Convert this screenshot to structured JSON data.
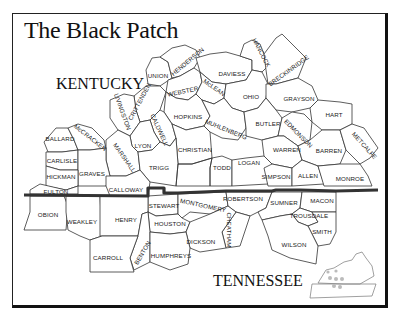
{
  "title": "The Black Patch",
  "states": {
    "kentucky": "KENTUCKY",
    "tennessee": "TENNESSEE"
  },
  "colors": {
    "ink": "#222222",
    "border_line": "#333333",
    "background": "#ffffff"
  },
  "counties": {
    "kentucky": [
      {
        "name": "UNION",
        "x": 158,
        "y": 76,
        "rot": 0
      },
      {
        "name": "HENDERSON",
        "x": 188,
        "y": 62,
        "rot": -40
      },
      {
        "name": "DAVIESS",
        "x": 232,
        "y": 74,
        "rot": 0
      },
      {
        "name": "HANCOCK",
        "x": 261,
        "y": 53,
        "rot": 62
      },
      {
        "name": "BRECKINRIDGE",
        "x": 289,
        "y": 71,
        "rot": -36
      },
      {
        "name": "WEBSTER",
        "x": 183,
        "y": 92,
        "rot": -12
      },
      {
        "name": "McLEAN",
        "x": 214,
        "y": 88,
        "rot": 35
      },
      {
        "name": "OHIO",
        "x": 251,
        "y": 97,
        "rot": 0
      },
      {
        "name": "GRAYSON",
        "x": 299,
        "y": 99,
        "rot": 0
      },
      {
        "name": "CRITTENDEN",
        "x": 140,
        "y": 102,
        "rot": -62
      },
      {
        "name": "LIVINGSTON",
        "x": 122,
        "y": 112,
        "rot": 70
      },
      {
        "name": "HOPKINS",
        "x": 188,
        "y": 117,
        "rot": 0
      },
      {
        "name": "MUHLENBERG",
        "x": 226,
        "y": 130,
        "rot": 22
      },
      {
        "name": "BUTLER",
        "x": 268,
        "y": 124,
        "rot": 0
      },
      {
        "name": "EDMONSON",
        "x": 298,
        "y": 134,
        "rot": 45
      },
      {
        "name": "HART",
        "x": 334,
        "y": 115,
        "rot": 0
      },
      {
        "name": "BALLARD",
        "x": 60,
        "y": 139,
        "rot": 0
      },
      {
        "name": "McCRACKEN",
        "x": 90,
        "y": 138,
        "rot": 38
      },
      {
        "name": "CALDWELL",
        "x": 159,
        "y": 130,
        "rot": 65
      },
      {
        "name": "LYON",
        "x": 143,
        "y": 146,
        "rot": 0
      },
      {
        "name": "MARSHALL",
        "x": 124,
        "y": 158,
        "rot": 55
      },
      {
        "name": "CHRISTIAN",
        "x": 195,
        "y": 150,
        "rot": 0
      },
      {
        "name": "WARREN",
        "x": 287,
        "y": 150,
        "rot": 0
      },
      {
        "name": "BARREN",
        "x": 329,
        "y": 151,
        "rot": 0
      },
      {
        "name": "METCALFE",
        "x": 364,
        "y": 146,
        "rot": 48
      },
      {
        "name": "CARLISLE",
        "x": 62,
        "y": 161,
        "rot": 0
      },
      {
        "name": "GRAVES",
        "x": 92,
        "y": 174,
        "rot": 0
      },
      {
        "name": "TRIGG",
        "x": 159,
        "y": 168,
        "rot": 0
      },
      {
        "name": "TODD",
        "x": 222,
        "y": 168,
        "rot": 0
      },
      {
        "name": "LOGAN",
        "x": 249,
        "y": 163,
        "rot": 0
      },
      {
        "name": "HICKMAN",
        "x": 61,
        "y": 177,
        "rot": 0
      },
      {
        "name": "SIMPSON",
        "x": 276,
        "y": 177,
        "rot": 0
      },
      {
        "name": "ALLEN",
        "x": 308,
        "y": 176,
        "rot": 0
      },
      {
        "name": "MONROE",
        "x": 350,
        "y": 179,
        "rot": 0
      },
      {
        "name": "FULTON",
        "x": 56,
        "y": 192,
        "rot": 0
      },
      {
        "name": "CALLOWAY",
        "x": 126,
        "y": 190,
        "rot": 0
      }
    ],
    "tennessee": [
      {
        "name": "STEWART",
        "x": 164,
        "y": 206,
        "rot": 0
      },
      {
        "name": "MONTGOMERY",
        "x": 203,
        "y": 206,
        "rot": 12
      },
      {
        "name": "ROBERTSON",
        "x": 243,
        "y": 199,
        "rot": 0
      },
      {
        "name": "SUMNER",
        "x": 284,
        "y": 203,
        "rot": 0
      },
      {
        "name": "MACON",
        "x": 322,
        "y": 201,
        "rot": 0
      },
      {
        "name": "OBION",
        "x": 48,
        "y": 215,
        "rot": 0
      },
      {
        "name": "WEAKLEY",
        "x": 82,
        "y": 222,
        "rot": 0
      },
      {
        "name": "HENRY",
        "x": 126,
        "y": 220,
        "rot": 0
      },
      {
        "name": "HOUSTON",
        "x": 170,
        "y": 224,
        "rot": 0
      },
      {
        "name": "CHEATHAM",
        "x": 229,
        "y": 230,
        "rot": 90
      },
      {
        "name": "TROUSDALE",
        "x": 309,
        "y": 216,
        "rot": 0
      },
      {
        "name": "SMITH",
        "x": 322,
        "y": 232,
        "rot": 0
      },
      {
        "name": "DICKSON",
        "x": 201,
        "y": 242,
        "rot": 0
      },
      {
        "name": "BENTON",
        "x": 143,
        "y": 253,
        "rot": -60
      },
      {
        "name": "CARROLL",
        "x": 108,
        "y": 258,
        "rot": 0
      },
      {
        "name": "HUMPHREYS",
        "x": 171,
        "y": 256,
        "rot": 0
      },
      {
        "name": "WILSON",
        "x": 294,
        "y": 245,
        "rot": 0
      }
    ]
  },
  "inset": {
    "label": "locator-map-ky-tn"
  }
}
